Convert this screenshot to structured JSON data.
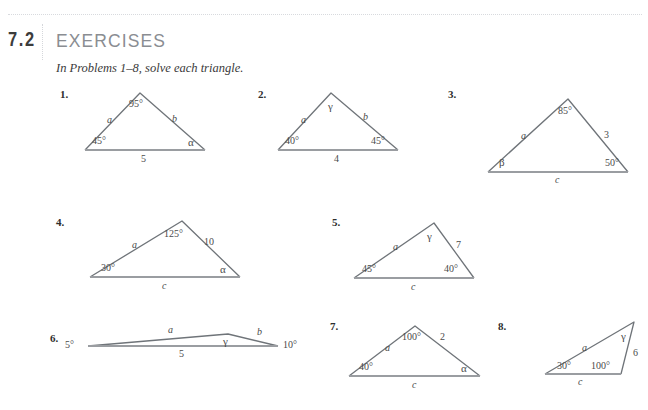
{
  "page": {
    "section_number": "7.2",
    "section_title": "EXERCISES",
    "instructions": "In Problems 1–8, solve each triangle."
  },
  "problems": [
    {
      "number": "1.",
      "labels": {
        "apex_angle": "95°",
        "left_angle": "45°",
        "right_angle": "α",
        "left_side": "a",
        "right_side": "b",
        "base": "5"
      }
    },
    {
      "number": "2.",
      "labels": {
        "apex_angle": "γ",
        "left_angle": "40°",
        "right_angle": "45°",
        "left_side": "a",
        "right_side": "b",
        "base": "4"
      }
    },
    {
      "number": "3.",
      "labels": {
        "apex_angle": "85°",
        "left_angle": "β",
        "right_angle": "50°",
        "left_side": "a",
        "right_side": "3",
        "base": "c"
      }
    },
    {
      "number": "4.",
      "labels": {
        "apex_angle": "125°",
        "left_angle": "30°",
        "right_angle": "α",
        "left_side": "a",
        "right_side": "10",
        "base": "c"
      }
    },
    {
      "number": "5.",
      "labels": {
        "apex_angle": "γ",
        "left_angle": "45°",
        "right_angle": "40°",
        "left_side": "a",
        "right_side": "7",
        "base": "c"
      }
    },
    {
      "number": "6.",
      "labels": {
        "apex_angle": "γ",
        "left_angle": "5°",
        "right_angle": "10°",
        "left_side": "a",
        "right_side": "b",
        "base": "5"
      }
    },
    {
      "number": "7.",
      "labels": {
        "apex_angle": "100°",
        "left_angle": "40°",
        "right_angle": "α",
        "left_side": "a",
        "right_side": "2",
        "base": "c"
      }
    },
    {
      "number": "8.",
      "labels": {
        "apex_angle": "γ",
        "left_angle": "30°",
        "right_angle": "100°",
        "left_side": "a",
        "right_side": "6",
        "base": "c"
      }
    }
  ],
  "style": {
    "stroke_color": "#6f7479",
    "base_color": "#9a9da1",
    "title_color": "#8a8d92",
    "text_color": "#3a3a3a"
  }
}
